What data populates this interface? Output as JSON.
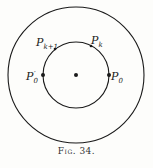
{
  "figure": {
    "caption": "Fig. 34.",
    "outer_circle": {
      "cx": 76,
      "cy": 75,
      "r": 68
    },
    "inner_circle": {
      "cx": 76,
      "cy": 75,
      "r": 33
    },
    "center_point": {
      "x": 76,
      "y": 75
    },
    "points": [
      {
        "id": "P0",
        "label": "P",
        "sub": "0",
        "prime": "",
        "x": 109,
        "y": 75
      },
      {
        "id": "P0prime",
        "label": "P",
        "sub": "0",
        "prime": "′",
        "x": 43,
        "y": 75
      },
      {
        "id": "Pk",
        "label": "P",
        "sub": "k",
        "prime": "",
        "x": 91,
        "y": 46
      },
      {
        "id": "Pk1",
        "label": "P",
        "sub": "k+1",
        "prime": "",
        "x": 55,
        "y": 49
      }
    ],
    "colors": {
      "ink": "#1a1a1a",
      "paper": "#fdfdfb"
    }
  }
}
